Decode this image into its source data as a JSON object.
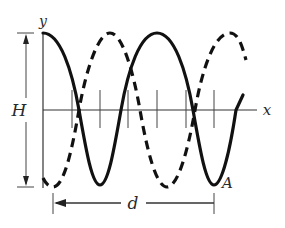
{
  "diagram": {
    "type": "transverse-wave-snapshot",
    "labels": {
      "y_axis": "y",
      "x_axis": "x",
      "amplitude_span": "H",
      "distance": "d",
      "point": "A"
    },
    "curves": [
      {
        "name": "solid-wave",
        "style": "solid",
        "description": "cosine starting at crest on y-axis; ends near x-axis crossing"
      },
      {
        "name": "dashed-wave",
        "style": "dashed",
        "description": "wave shifted by half wavelength; starts at trough"
      }
    ],
    "colors": {
      "line": "#111111",
      "axis": "#333333",
      "background": "#ffffff"
    },
    "tick_count": 6
  }
}
